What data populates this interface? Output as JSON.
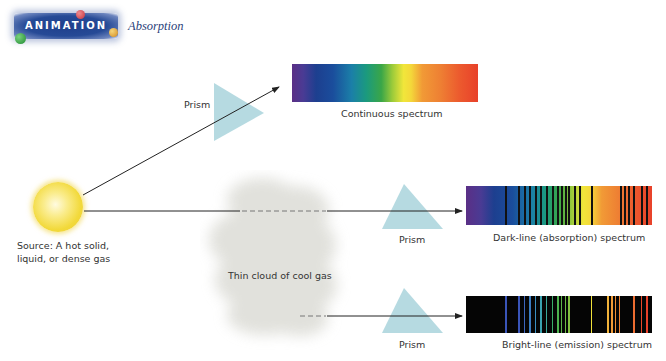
{
  "header": {
    "badge_label": "ANIMATION",
    "title": "Absorption",
    "badge_colors": {
      "bg": "#264a96",
      "dot_red": "#d2454e",
      "dot_green": "#2f9a3e",
      "dot_yellow": "#e7a82a"
    }
  },
  "source": {
    "label_line1": "Source:  A hot solid,",
    "label_line2": "liquid, or dense gas",
    "color": "#f3dc3c"
  },
  "cloud": {
    "label": "Thin cloud of cool gas"
  },
  "prisms": [
    {
      "label": "Prism"
    },
    {
      "label": "Prism"
    },
    {
      "label": "Prism"
    }
  ],
  "spectra": {
    "continuous": {
      "label": "Continuous spectrum"
    },
    "absorption": {
      "label": "Dark-line (absorption) spectrum",
      "line_positions_pct": [
        21,
        28,
        31,
        34,
        37,
        40,
        43,
        46,
        49,
        51,
        53,
        55,
        58,
        61,
        67,
        83,
        85,
        87,
        90,
        94,
        97
      ]
    },
    "emission": {
      "label": "Bright-line (emission) spectrum",
      "lines": [
        {
          "pos": 21,
          "color": "#3a55b8"
        },
        {
          "pos": 28,
          "color": "#3a55b8"
        },
        {
          "pos": 31,
          "color": "#3d66bd"
        },
        {
          "pos": 34,
          "color": "#3a7cc2"
        },
        {
          "pos": 37,
          "color": "#3a8fc0"
        },
        {
          "pos": 40,
          "color": "#3aa2b0"
        },
        {
          "pos": 43,
          "color": "#3aa89a"
        },
        {
          "pos": 46,
          "color": "#3aae6a"
        },
        {
          "pos": 49,
          "color": "#4cb24e"
        },
        {
          "pos": 51,
          "color": "#5cb648"
        },
        {
          "pos": 53,
          "color": "#6cba44"
        },
        {
          "pos": 55,
          "color": "#82c040"
        },
        {
          "pos": 67,
          "color": "#f1e23a"
        },
        {
          "pos": 76,
          "color": "#f2b33a"
        },
        {
          "pos": 78,
          "color": "#f09a36"
        },
        {
          "pos": 80,
          "color": "#ee8e34"
        },
        {
          "pos": 82,
          "color": "#ee8332"
        },
        {
          "pos": 90,
          "color": "#ec6c30"
        },
        {
          "pos": 94,
          "color": "#e84a2a"
        },
        {
          "pos": 97,
          "color": "#e8412a"
        }
      ]
    }
  }
}
